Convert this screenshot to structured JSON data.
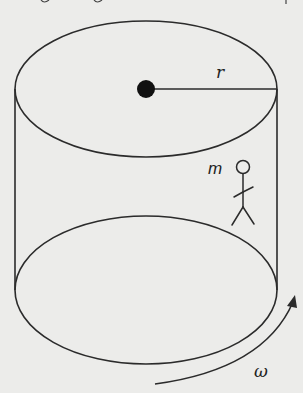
{
  "diagram": {
    "type": "rotating-cylinder",
    "labels": {
      "radius": "r",
      "mass": "m",
      "angular_velocity": "ω"
    },
    "elements": {
      "top_ellipse": {
        "cx": 146,
        "cy": 89,
        "rx": 132,
        "ry": 68
      },
      "bottom_ellipse": {
        "cx": 146,
        "cy": 290,
        "rx": 132,
        "ry": 74
      },
      "axis_dot": {
        "cx": 146,
        "cy": 89,
        "r": 9
      },
      "radius_line": {
        "x1": 146,
        "y1": 89,
        "x2": 278,
        "y2": 89
      },
      "person": {
        "x": 243,
        "y": 167
      },
      "rotation_arrow": "counterclockwise arrow at lower right"
    },
    "colors": {
      "background": "#ececea",
      "stroke": "#2b2b2b",
      "ink": "#111111"
    }
  }
}
